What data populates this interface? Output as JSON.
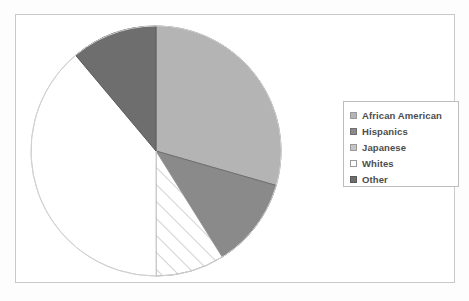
{
  "chart_data": {
    "type": "pie",
    "title": "",
    "legend_position": "right",
    "grid": false,
    "categories": [
      "African American",
      "Hispanics",
      "Japanese",
      "Whites",
      "Other"
    ],
    "values": [
      29.5,
      11.5,
      9.0,
      39.0,
      11.0
    ],
    "units": "percent",
    "start_angle_deg": 0,
    "direction": "clockwise",
    "slices": [
      {
        "label": "African American",
        "value": 29.5,
        "start_deg": 0,
        "end_deg": 106,
        "fill": "#b4b4b4",
        "pattern": "solid",
        "stroke": "#8d8d8d"
      },
      {
        "label": "Hispanics",
        "value": 11.5,
        "start_deg": 106,
        "end_deg": 148,
        "fill": "#8a8a8a",
        "pattern": "solid",
        "stroke": "#6f6f6f"
      },
      {
        "label": "Japanese",
        "value": 9.0,
        "start_deg": 148,
        "end_deg": 180,
        "fill": "#ffffff",
        "pattern": "diagonal",
        "stroke": "#9a9a9a"
      },
      {
        "label": "Whites",
        "value": 39.0,
        "start_deg": 180,
        "end_deg": 320,
        "fill": "#ffffff",
        "pattern": "solid",
        "stroke": "#cccccc"
      },
      {
        "label": "Other",
        "value": 11.0,
        "start_deg": 320,
        "end_deg": 360,
        "fill": "#6e6e6e",
        "pattern": "solid",
        "stroke": "#5a5a5a"
      }
    ]
  },
  "legend": {
    "items": [
      {
        "label": "African American",
        "swatch_fill": "#b4b4b4",
        "swatch_border": "#9a9a9a"
      },
      {
        "label": "Hispanics",
        "swatch_fill": "#8a8a8a",
        "swatch_border": "#6f6f6f"
      },
      {
        "label": "Japanese",
        "swatch_fill": "#c5c5c5",
        "swatch_border": "#9a9a9a"
      },
      {
        "label": "Whites",
        "swatch_fill": "#ffffff",
        "swatch_border": "#9a9a9a"
      },
      {
        "label": "Other",
        "swatch_fill": "#6e6e6e",
        "swatch_border": "#5a5a5a"
      }
    ]
  },
  "frame": {
    "border_color": "#c9c9c9",
    "background": "#ffffff"
  }
}
